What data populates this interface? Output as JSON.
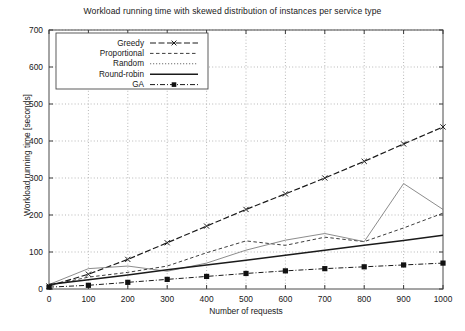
{
  "chart_data": {
    "type": "line",
    "title": "Workload running time with skewed distribution of instances per service type",
    "xlabel": "Number of requests",
    "ylabel": "Workload running time [seconds]",
    "xlim": [
      0,
      1000
    ],
    "ylim": [
      0,
      700
    ],
    "xticks": [
      0,
      100,
      200,
      300,
      400,
      500,
      600,
      700,
      800,
      900,
      1000
    ],
    "yticks": [
      0,
      100,
      200,
      300,
      400,
      500,
      600,
      700
    ],
    "grid": true,
    "legend_position": "top-left inside",
    "x": [
      0,
      100,
      200,
      300,
      400,
      500,
      600,
      700,
      800,
      900,
      1000
    ],
    "series": [
      {
        "name": "Greedy",
        "style": "dashed-with-x-markers",
        "values": [
          8,
          40,
          80,
          125,
          170,
          215,
          257,
          300,
          345,
          392,
          438
        ]
      },
      {
        "name": "Proportional",
        "style": "dashed",
        "values": [
          10,
          32,
          45,
          62,
          98,
          130,
          118,
          140,
          128,
          165,
          205
        ]
      },
      {
        "name": "Random",
        "style": "dotted",
        "values": [
          12,
          55,
          62,
          48,
          70,
          105,
          132,
          150,
          128,
          285,
          215
        ]
      },
      {
        "name": "Round-robin",
        "style": "solid",
        "values": [
          12,
          25,
          38,
          52,
          65,
          78,
          91,
          105,
          118,
          131,
          145
        ]
      },
      {
        "name": "GA",
        "style": "dash-dot-with-square-markers",
        "values": [
          5,
          10,
          18,
          26,
          34,
          42,
          49,
          55,
          60,
          65,
          70
        ]
      }
    ]
  },
  "legend": {
    "items": [
      {
        "label": "Greedy"
      },
      {
        "label": "Proportional"
      },
      {
        "label": "Random"
      },
      {
        "label": "Round-robin"
      },
      {
        "label": "GA"
      }
    ]
  },
  "axes": {
    "x_tick_labels": [
      "0",
      "100",
      "200",
      "300",
      "400",
      "500",
      "600",
      "700",
      "800",
      "900",
      "1000"
    ],
    "y_tick_labels": [
      "0",
      "100",
      "200",
      "300",
      "400",
      "500",
      "600",
      "700"
    ]
  }
}
